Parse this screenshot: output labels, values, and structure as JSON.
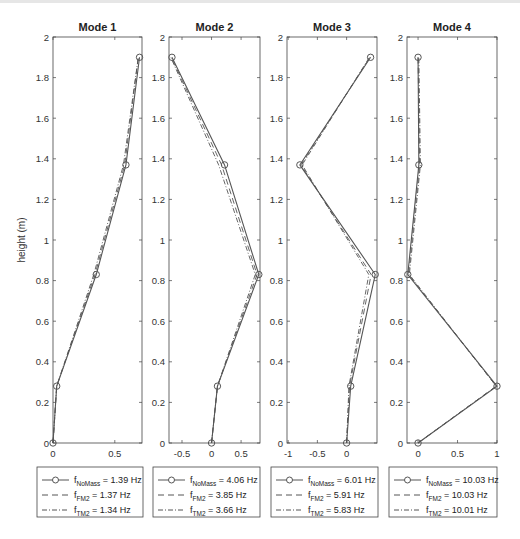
{
  "chart_data": [
    {
      "type": "line",
      "title": "Mode 1",
      "xlabel": "",
      "ylabel": "height (m)",
      "xlim": [
        0,
        0.72
      ],
      "ylim": [
        0,
        2
      ],
      "xticks": [
        0,
        0.5
      ],
      "yticks": [
        0,
        0.2,
        0.4,
        0.6,
        0.8,
        1,
        1.2,
        1.4,
        1.6,
        1.8,
        2
      ],
      "grid": false,
      "legend_position": "below",
      "y": [
        0,
        0.28,
        0.83,
        1.37,
        1.9
      ],
      "series": [
        {
          "name": "f_NoMass = 1.39 Hz",
          "sub": "NoMass",
          "value_label": " = 1.39 Hz",
          "style": "solid-circle",
          "values": [
            0,
            0.03,
            0.35,
            0.59,
            0.7
          ]
        },
        {
          "name": "f_FM2 = 1.37 Hz",
          "sub": "FM2",
          "value_label": " = 1.37 Hz",
          "style": "dashed",
          "values": [
            0,
            0.03,
            0.34,
            0.58,
            0.69
          ]
        },
        {
          "name": "f_TM2 = 1.34 Hz",
          "sub": "TM2",
          "value_label": " = 1.34 Hz",
          "style": "dashdot",
          "values": [
            0,
            0.03,
            0.33,
            0.57,
            0.69
          ]
        }
      ]
    },
    {
      "type": "line",
      "title": "Mode 2",
      "xlabel": "",
      "ylabel": "",
      "xlim": [
        -0.72,
        0.82
      ],
      "ylim": [
        0,
        2
      ],
      "xticks": [
        -0.5,
        0,
        0.5
      ],
      "yticks": [
        0,
        0.2,
        0.4,
        0.6,
        0.8,
        1,
        1.2,
        1.4,
        1.6,
        1.8,
        2
      ],
      "grid": false,
      "legend_position": "below",
      "y": [
        0,
        0.28,
        0.83,
        1.37,
        1.9
      ],
      "series": [
        {
          "name": "f_NoMass = 4.06 Hz",
          "sub": "NoMass",
          "value_label": " = 4.06 Hz",
          "style": "solid-circle",
          "values": [
            0,
            0.1,
            0.8,
            0.22,
            -0.67
          ]
        },
        {
          "name": "f_FM2 = 3.85 Hz",
          "sub": "FM2",
          "value_label": " = 3.85 Hz",
          "style": "dashed",
          "values": [
            0,
            0.1,
            0.77,
            0.17,
            -0.68
          ]
        },
        {
          "name": "f_TM2 = 3.66 Hz",
          "sub": "TM2",
          "value_label": " = 3.66 Hz",
          "style": "dashdot",
          "values": [
            0,
            0.1,
            0.74,
            0.12,
            -0.69
          ]
        }
      ]
    },
    {
      "type": "line",
      "title": "Mode 3",
      "xlabel": "",
      "ylabel": "",
      "xlim": [
        -1.02,
        0.52
      ],
      "ylim": [
        0,
        2
      ],
      "xticks": [
        -1,
        -0.5,
        0
      ],
      "yticks": [
        0,
        0.2,
        0.4,
        0.6,
        0.8,
        1,
        1.2,
        1.4,
        1.6,
        1.8,
        2
      ],
      "grid": false,
      "legend_position": "below",
      "y": [
        0,
        0.28,
        0.83,
        1.37,
        1.9
      ],
      "series": [
        {
          "name": "f_NoMass = 6.01 Hz",
          "sub": "NoMass",
          "value_label": " = 6.01 Hz",
          "style": "solid-circle",
          "values": [
            0,
            0.07,
            0.49,
            -0.8,
            0.41
          ]
        },
        {
          "name": "f_FM2 = 5.91 Hz",
          "sub": "FM2",
          "value_label": " = 5.91 Hz",
          "style": "dashed",
          "values": [
            0,
            0.05,
            0.42,
            -0.78,
            0.4
          ]
        },
        {
          "name": "f_TM2 = 5.83 Hz",
          "sub": "TM2",
          "value_label": " = 5.83 Hz",
          "style": "dashdot",
          "values": [
            0,
            0.04,
            0.38,
            -0.76,
            0.39
          ]
        }
      ]
    },
    {
      "type": "line",
      "title": "Mode 4",
      "xlabel": "",
      "ylabel": "",
      "xlim": [
        -0.14,
        1.0
      ],
      "ylim": [
        0,
        2
      ],
      "xticks": [
        0,
        0.5,
        1
      ],
      "yticks": [
        0,
        0.2,
        0.4,
        0.6,
        0.8,
        1,
        1.2,
        1.4,
        1.6,
        1.8,
        2
      ],
      "grid": false,
      "legend_position": "below",
      "y": [
        0,
        0.28,
        0.83,
        1.37,
        1.9
      ],
      "series": [
        {
          "name": "f_NoMass = 10.03 Hz",
          "sub": "NoMass",
          "value_label": " = 10.03 Hz",
          "style": "solid-circle",
          "values": [
            0,
            1.0,
            -0.13,
            0.01,
            0
          ]
        },
        {
          "name": "f_FM2 = 10.03 Hz",
          "sub": "FM2",
          "value_label": " = 10.03 Hz",
          "style": "dashed",
          "values": [
            0,
            0.99,
            -0.12,
            0.02,
            0
          ]
        },
        {
          "name": "f_TM2 = 10.01 Hz",
          "sub": "TM2",
          "value_label": " = 10.01 Hz",
          "style": "dashdot",
          "values": [
            0,
            0.99,
            -0.11,
            0.03,
            0.01
          ]
        }
      ]
    }
  ],
  "figure": {
    "ylabel": "height (m)",
    "line_color": "#555555",
    "axis_color": "#444444"
  }
}
